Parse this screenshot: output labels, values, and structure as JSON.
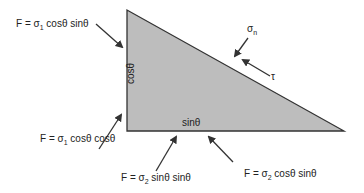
{
  "diagram": {
    "type": "stress element free-body triangle",
    "fill_color": "#bdbdbd",
    "edge_color": "#333333",
    "side_labels": {
      "vertical": "cosθ",
      "horizontal": "sinθ"
    },
    "hypotenuse_labels": {
      "normal_stress": {
        "symbol": "σ",
        "sub": "n"
      },
      "shear_stress": "τ"
    },
    "force_labels": [
      {
        "id": "top-left",
        "prefix": "F = σ",
        "sub": "1",
        "suffix": " cosθ sinθ"
      },
      {
        "id": "bottom-left",
        "prefix": "F = σ",
        "sub": "1",
        "suffix": " cosθ cosθ"
      },
      {
        "id": "bottom-middle",
        "prefix": "F = σ",
        "sub": "2",
        "suffix": " sinθ sinθ"
      },
      {
        "id": "bottom-right",
        "prefix": "F = σ",
        "sub": "2",
        "suffix": " cosθ sinθ"
      }
    ]
  }
}
